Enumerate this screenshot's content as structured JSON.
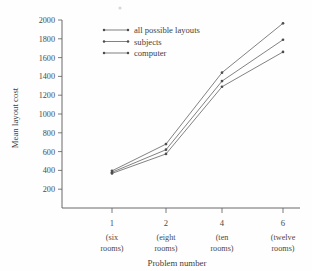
{
  "chart_data": {
    "type": "line",
    "title": "",
    "xlabel": "Problem number",
    "ylabel": "Mean layout cost",
    "x": [
      1,
      2,
      4,
      6
    ],
    "categories": [
      "1",
      "2",
      "4",
      "6"
    ],
    "category_sublabels": [
      [
        "(six",
        "rooms)"
      ],
      [
        "(eight",
        "rooms)"
      ],
      [
        "(ten",
        "rooms)"
      ],
      [
        "(twelve",
        "rooms)"
      ]
    ],
    "ylim": [
      0,
      2000
    ],
    "yticks": [
      200,
      400,
      600,
      800,
      1000,
      1200,
      1400,
      1600,
      1800,
      2000
    ],
    "ytick_labels": [
      "200",
      "400",
      "600",
      "800",
      "1000",
      "1200",
      "1400",
      "1600",
      "1800",
      "2000"
    ],
    "grid": false,
    "legend_position": "upper-left-inside",
    "series": [
      {
        "name": "all possible layouts",
        "values": [
          395,
          680,
          1440,
          1965
        ],
        "marker": "dot",
        "color": "#6b6b6b"
      },
      {
        "name": "subjects",
        "values": [
          380,
          620,
          1350,
          1790
        ],
        "marker": "dot",
        "color": "#6b6b6b"
      },
      {
        "name": "computer",
        "values": [
          368,
          575,
          1290,
          1660
        ],
        "marker": "dot",
        "color": "#6b6b6b"
      }
    ]
  },
  "legend": {
    "items": [
      {
        "label": "all possible layouts"
      },
      {
        "label": "subjects"
      },
      {
        "label": "computer"
      }
    ]
  },
  "axes": {
    "y_title": "Mean layout cost",
    "x_title": "Problem number"
  }
}
